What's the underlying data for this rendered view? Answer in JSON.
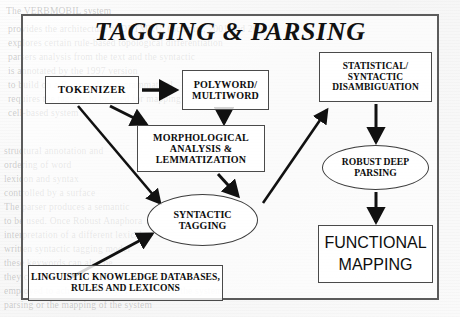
{
  "diagram": {
    "title": "TAGGING & PARSING",
    "type": "flowchart",
    "nodes": [
      {
        "id": "tokenizer",
        "label": "TOKENIZER",
        "shape": "rect"
      },
      {
        "id": "polyword",
        "label": "POLYWORD/\nMULTIWORD",
        "shape": "rect"
      },
      {
        "id": "morphological",
        "label": "MORPHOLOGICAL\nANALYSIS &\nLEMMATIZATION",
        "shape": "rect"
      },
      {
        "id": "statistical",
        "label": "STATISTICAL/\nSYNTACTIC\nDISAMBIGUATION",
        "shape": "rect"
      },
      {
        "id": "robust",
        "label": "ROBUST DEEP\nPARSING",
        "shape": "ellipse"
      },
      {
        "id": "syntactic",
        "label": "SYNTACTIC\nTAGGING",
        "shape": "ellipse"
      },
      {
        "id": "functional",
        "label": "FUNCTIONAL\nMAPPING",
        "shape": "rect"
      },
      {
        "id": "linguistic",
        "label": "LINGUISTIC KNOWLEDGE DATABASES,\nRULES AND LEXICONS",
        "shape": "rect"
      }
    ],
    "edges": [
      {
        "from": "tokenizer",
        "to": "polyword"
      },
      {
        "from": "tokenizer",
        "to": "morphological"
      },
      {
        "from": "tokenizer",
        "to": "syntactic"
      },
      {
        "from": "polyword",
        "to": "morphological"
      },
      {
        "from": "morphological",
        "to": "syntactic"
      },
      {
        "from": "syntactic",
        "to": "statistical"
      },
      {
        "from": "statistical",
        "to": "robust"
      },
      {
        "from": "robust",
        "to": "functional"
      },
      {
        "from": "linguistic",
        "to": "syntactic"
      }
    ],
    "colors": {
      "frame": "#5b5b5b",
      "box_border": "#4a4a4a",
      "arrow": "#111111",
      "text": "#0d0d0d",
      "page": "#fbfbfb"
    }
  },
  "background_text": {
    "lines": [
      {
        "text": "The VERBMOBIL system",
        "x": 6,
        "y": 6
      },
      {
        "text": "provides the architecture of DETMKU. (Schmitz, 2001 and 2000)",
        "x": 8,
        "y": 24
      },
      {
        "text": "explores certain rule-based topological differentiation",
        "x": 8,
        "y": 38
      },
      {
        "text": "parsers analysis from the text and the syntactic",
        "x": 8,
        "y": 52
      },
      {
        "text": "is annotated by the 1997 version",
        "x": 8,
        "y": 66
      },
      {
        "text": "to build on a R- as-well-as a grammatical",
        "x": 8,
        "y": 80
      },
      {
        "text": "requires the taggers to be used for mapping",
        "x": 8,
        "y": 94
      },
      {
        "text": "cell-based system",
        "x": 8,
        "y": 108
      },
      {
        "text": "structural annotation and",
        "x": 4,
        "y": 146
      },
      {
        "text": "ordering of word",
        "x": 4,
        "y": 160
      },
      {
        "text": "lexicon and syntax",
        "x": 4,
        "y": 174
      },
      {
        "text": "controlled by a surface",
        "x": 4,
        "y": 188
      },
      {
        "text": "The parser produces a semantic",
        "x": 4,
        "y": 202
      },
      {
        "text": "to be used. Once Robust Anaphora",
        "x": 4,
        "y": 216
      },
      {
        "text": "interpretation of a different lexical",
        "x": 4,
        "y": 230
      },
      {
        "text": "written syntactic tagging model",
        "x": 4,
        "y": 244
      },
      {
        "text": "these keywords can also be",
        "x": 4,
        "y": 258
      },
      {
        "text": "they chose are compared to both",
        "x": 4,
        "y": 272
      },
      {
        "text": "employed to achieve literacy. The output of the system",
        "x": 4,
        "y": 286
      },
      {
        "text": "parsing or the mapping of the system",
        "x": 4,
        "y": 300
      }
    ]
  }
}
